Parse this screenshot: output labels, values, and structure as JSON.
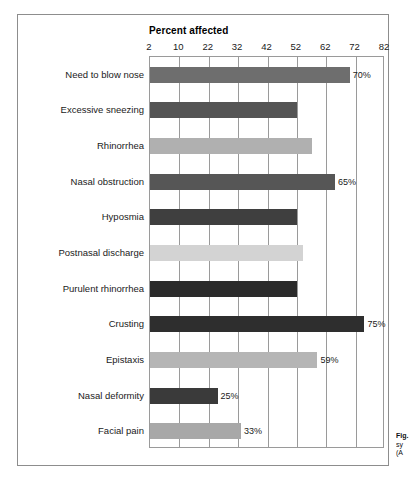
{
  "figure": {
    "caption_lines": [
      "Fig.",
      "sy",
      "(A"
    ]
  },
  "chart_data": {
    "type": "bar",
    "orientation": "horizontal",
    "title": "Percent affected",
    "xlabel": "Percent affected",
    "ylabel": "",
    "xlim": [
      2,
      82
    ],
    "xticks": [
      2,
      10,
      22,
      32,
      42,
      52,
      62,
      72,
      82
    ],
    "xtick_labels": [
      "2",
      "10",
      "22",
      "32",
      "42",
      "52",
      "62",
      "72",
      "82"
    ],
    "grid": true,
    "legend": "none",
    "categories": [
      "Need to blow nose",
      "Excessive sneezing",
      "Rhinorrhea",
      "Nasal obstruction",
      "Hyposmia",
      "Postnasal discharge",
      "Purulent rhinorrhea",
      "Crusting",
      "Epistaxis",
      "Nasal deformity",
      "Facial pain"
    ],
    "values": [
      70,
      52,
      57,
      65,
      52,
      54,
      52,
      75,
      59,
      25,
      33
    ],
    "value_labels": [
      "70%",
      "",
      "",
      "65%",
      "",
      "",
      "",
      "75%",
      "59%",
      "25%",
      "33%"
    ],
    "bar_colors": [
      "#6e6e6e",
      "#545454",
      "#b0b0b0",
      "#565656",
      "#3f3f3f",
      "#d3d3d3",
      "#2b2b2b",
      "#2e2e2e",
      "#b5b5b5",
      "#3a3a3a",
      "#a8a8a8"
    ],
    "axis_color": "#9a9a9a",
    "frame_color": "#8d8d8d",
    "text_color": "#1a1a1a"
  }
}
